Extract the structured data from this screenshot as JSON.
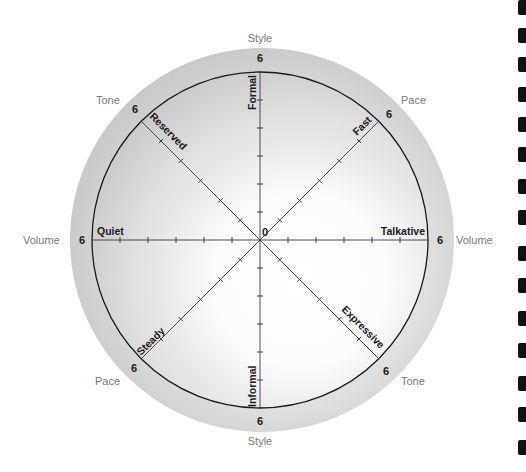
{
  "diagram": {
    "type": "radial-scale-wheel",
    "center_label": "0",
    "scale_max": 6,
    "ticks_per_axis": 6,
    "colors": {
      "outer_disc": "#c8c8c8",
      "inner_fill_light": "#ffffff",
      "inner_fill_dark": "#bdbdbd",
      "axis_line": "#444444",
      "circle_line": "#1a1a1a",
      "category_text": "#7a7a7a",
      "pole_text": "#1a1a1a"
    },
    "dimensions": [
      {
        "name": "Style",
        "pole_a": "Formal",
        "pole_a_position": "top",
        "pole_b": "Informal",
        "pole_b_position": "bottom"
      },
      {
        "name": "Volume",
        "pole_a": "Quiet",
        "pole_a_position": "left",
        "pole_b": "Talkative",
        "pole_b_position": "right"
      },
      {
        "name": "Pace",
        "pole_a": "Fast",
        "pole_a_position": "upper-right",
        "pole_b": "Steady",
        "pole_b_position": "lower-left"
      },
      {
        "name": "Tone",
        "pole_a": "Reserved",
        "pole_a_position": "upper-left",
        "pole_b": "Expressive",
        "pole_b_position": "lower-right"
      }
    ],
    "labels": {
      "style_top": "Style",
      "style_bottom": "Style",
      "volume_left": "Volume",
      "volume_right": "Volume",
      "pace_upper_right": "Pace",
      "pace_lower_left": "Pace",
      "tone_upper_left": "Tone",
      "tone_lower_right": "Tone",
      "six": "6",
      "formal": "Formal",
      "informal": "Informal",
      "quiet": "Quiet",
      "talkative": "Talkative",
      "fast": "Fast",
      "steady": "Steady",
      "reserved": "Reserved",
      "expressive": "Expressive"
    }
  },
  "edge_marks_count": 15
}
